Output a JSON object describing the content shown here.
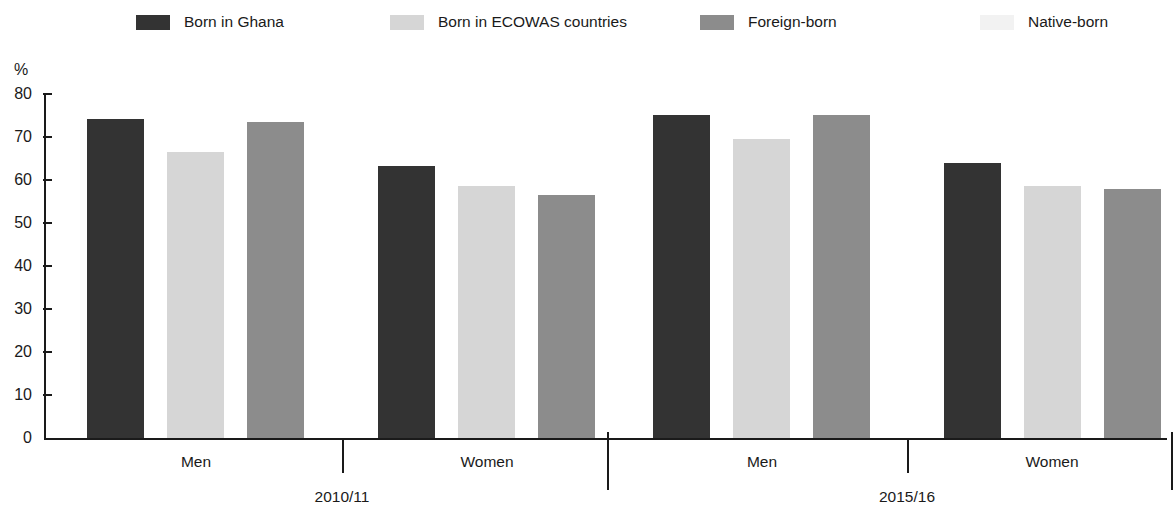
{
  "chart_data": {
    "type": "bar",
    "title": "",
    "xlabel": "",
    "ylabel": "%",
    "ylim": [
      0,
      80
    ],
    "ytick_step": 10,
    "yticks": [
      80,
      70,
      60,
      50,
      40,
      30,
      20,
      10,
      0
    ],
    "grid": false,
    "legend_position": "top",
    "legend": [
      {
        "label": "Born in Ghana",
        "color": "#333333",
        "swatch_icon": "legend-swatch-dark"
      },
      {
        "label": "Born in ECOWAS countries",
        "color": "#d6d6d6",
        "swatch_icon": "legend-swatch-light"
      },
      {
        "label": "Foreign-born",
        "color": "#8c8c8c",
        "swatch_icon": "legend-swatch-medium"
      },
      {
        "label": "Native-born",
        "color": "#f2f2f2",
        "swatch_icon": "legend-swatch-faint"
      }
    ],
    "categories": [
      "Men",
      "Women",
      "Men",
      "Women"
    ],
    "groups": [
      {
        "label": "2010/11",
        "categories": [
          "Men",
          "Women"
        ]
      },
      {
        "label": "2015/16",
        "categories": [
          "Men",
          "Women"
        ]
      }
    ],
    "series": [
      {
        "name": "Born in Ghana",
        "color": "#333333",
        "values": [
          74.2,
          63.3,
          75.2,
          63.9
        ]
      },
      {
        "name": "Born in ECOWAS countries",
        "color": "#d6d6d6",
        "values": [
          66.6,
          58.5,
          69.6,
          58.7
        ]
      },
      {
        "name": "Foreign-born",
        "color": "#8c8c8c",
        "values": [
          73.6,
          56.6,
          75.1,
          57.9
        ]
      }
    ],
    "bars": [
      {
        "group": "2010/11",
        "category": "Men",
        "series": "Born in Ghana",
        "value": 74.2,
        "color": "#333333",
        "x": 43,
        "width": 57
      },
      {
        "group": "2010/11",
        "category": "Men",
        "series": "Born in ECOWAS countries",
        "value": 66.6,
        "color": "#d6d6d6",
        "x": 123,
        "width": 57
      },
      {
        "group": "2010/11",
        "category": "Men",
        "series": "Foreign-born",
        "value": 73.6,
        "color": "#8c8c8c",
        "x": 203,
        "width": 57
      },
      {
        "group": "2010/11",
        "category": "Women",
        "series": "Born in Ghana",
        "value": 63.3,
        "color": "#333333",
        "x": 334,
        "width": 57
      },
      {
        "group": "2010/11",
        "category": "Women",
        "series": "Born in ECOWAS countries",
        "value": 58.5,
        "color": "#d6d6d6",
        "x": 414,
        "width": 57
      },
      {
        "group": "2010/11",
        "category": "Women",
        "series": "Foreign-born",
        "value": 56.6,
        "color": "#8c8c8c",
        "x": 494,
        "width": 57
      },
      {
        "group": "2015/16",
        "category": "Men",
        "series": "Born in Ghana",
        "value": 75.2,
        "color": "#333333",
        "x": 609,
        "width": 57
      },
      {
        "group": "2015/16",
        "category": "Men",
        "series": "Born in ECOWAS countries",
        "value": 69.6,
        "color": "#d6d6d6",
        "x": 689,
        "width": 57
      },
      {
        "group": "2015/16",
        "category": "Men",
        "series": "Foreign-born",
        "value": 75.1,
        "color": "#8c8c8c",
        "x": 769,
        "width": 57
      },
      {
        "group": "2015/16",
        "category": "Women",
        "series": "Born in Ghana",
        "value": 63.9,
        "color": "#333333",
        "x": 900,
        "width": 57
      },
      {
        "group": "2015/16",
        "category": "Women",
        "series": "Born in ECOWAS countries",
        "value": 58.7,
        "color": "#d6d6d6",
        "x": 980,
        "width": 57
      },
      {
        "group": "2015/16",
        "category": "Women",
        "series": "Foreign-born",
        "value": 57.9,
        "color": "#8c8c8c",
        "x": 1060,
        "width": 57
      }
    ]
  },
  "layout": {
    "legend_items_x": [
      136,
      390,
      700,
      980
    ],
    "category_label_positions": [
      {
        "label": "Men",
        "center": 152
      },
      {
        "label": "Women",
        "center": 443
      },
      {
        "label": "Men",
        "center": 718
      },
      {
        "label": "Women",
        "center": 1008
      }
    ],
    "group_label_positions": [
      {
        "label": "2010/11",
        "center": 298
      },
      {
        "label": "2015/16",
        "center": 863
      }
    ],
    "separators_x": [
      298,
      563,
      863,
      1127
    ]
  }
}
